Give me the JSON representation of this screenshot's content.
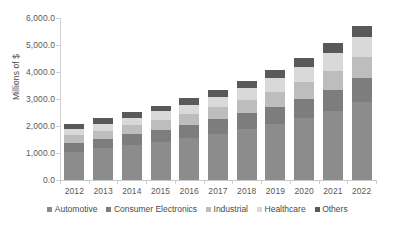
{
  "chart_data": {
    "type": "bar",
    "subtype": "stacked-bar",
    "title": "",
    "xlabel": "",
    "ylabel": "Millions of $",
    "ylim": [
      0,
      6000
    ],
    "ytick_step": 1000,
    "ytick_labels": [
      "0.0",
      "1,000.0",
      "2,000.0",
      "3,000.0",
      "4,000.0",
      "5,000.0",
      "6,000.0"
    ],
    "ytick_values": [
      0,
      1000,
      2000,
      3000,
      4000,
      5000,
      6000
    ],
    "grid": false,
    "legend_position": "bottom",
    "categories": [
      "2012",
      "2013",
      "2014",
      "2015",
      "2016",
      "2017",
      "2018",
      "2019",
      "2020",
      "2021",
      "2022"
    ],
    "series": [
      {
        "name": "Automotive",
        "color": "#8c8c8c",
        "values": [
          1050,
          1170,
          1290,
          1420,
          1560,
          1720,
          1890,
          2080,
          2300,
          2560,
          2880
        ]
      },
      {
        "name": "Consumer Electronics",
        "color": "#7d7d7d",
        "values": [
          330,
          360,
          400,
          440,
          480,
          530,
          580,
          640,
          710,
          790,
          890
        ]
      },
      {
        "name": "Industrial",
        "color": "#bdbdbd",
        "values": [
          280,
          300,
          330,
          360,
          400,
          440,
          490,
          550,
          620,
          700,
          800
        ]
      },
      {
        "name": "Healthcare",
        "color": "#d9d9d9",
        "values": [
          240,
          260,
          290,
          320,
          350,
          390,
          440,
          500,
          570,
          650,
          740
        ]
      },
      {
        "name": "Others",
        "color": "#595959",
        "values": [
          180,
          190,
          200,
          220,
          240,
          260,
          280,
          300,
          330,
          360,
          400
        ]
      }
    ],
    "totals": [
      2080,
      2280,
      2510,
      2760,
      3030,
      3340,
      3680,
      4070,
      4530,
      5060,
      5710
    ]
  },
  "axis": {
    "y_title": "Millions of $"
  }
}
